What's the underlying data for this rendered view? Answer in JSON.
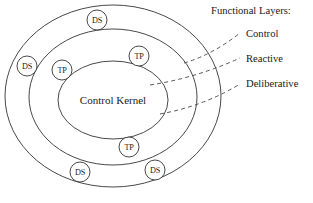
{
  "diagram": {
    "title_text": "Functional Layers:",
    "kernel_label": "Control Kernel",
    "stroke_color": "#333333",
    "text_color": "#1a1a1a",
    "background_color": "#ffffff",
    "ellipses": [
      {
        "name": "outer-ellipse",
        "cx": 113,
        "cy": 96,
        "rx": 108,
        "ry": 91
      },
      {
        "name": "middle-ellipse",
        "cx": 113,
        "cy": 97,
        "rx": 84,
        "ry": 68
      },
      {
        "name": "inner-ellipse",
        "cx": 113,
        "cy": 100,
        "rx": 55,
        "ry": 39
      }
    ],
    "nodes": [
      {
        "id": "ds-top",
        "label": "DS",
        "cx": 97,
        "cy": 20,
        "r": 10
      },
      {
        "id": "ds-left",
        "label": "DS",
        "cx": 27,
        "cy": 66,
        "r": 10
      },
      {
        "id": "ds-bottom-left",
        "label": "DS",
        "cx": 80,
        "cy": 172,
        "r": 10
      },
      {
        "id": "ds-bottom-right",
        "label": "DS",
        "cx": 155,
        "cy": 170,
        "r": 10
      },
      {
        "id": "tp-left",
        "label": "TP",
        "cx": 62,
        "cy": 70,
        "r": 10
      },
      {
        "id": "tp-upper-right",
        "label": "TP",
        "cx": 139,
        "cy": 56,
        "r": 10
      },
      {
        "id": "tp-bottom",
        "label": "TP",
        "cx": 129,
        "cy": 147,
        "r": 10
      }
    ],
    "leaders": [
      {
        "id": "leader-control",
        "x1": 184,
        "y1": 63,
        "x2": 240,
        "y2": 33
      },
      {
        "id": "leader-reactive",
        "x1": 150,
        "y1": 85,
        "x2": 240,
        "y2": 58
      },
      {
        "id": "leader-deliberative",
        "x1": 160,
        "y1": 114,
        "x2": 240,
        "y2": 84
      }
    ],
    "layers": [
      {
        "id": "layer-control",
        "label": "Control",
        "x": 246,
        "y": 33
      },
      {
        "id": "layer-reactive",
        "label": "Reactive",
        "x": 246,
        "y": 58
      },
      {
        "id": "layer-deliberative",
        "label": "Deliberative",
        "x": 246,
        "y": 83
      }
    ],
    "title_position": {
      "x": 211,
      "y": 10
    }
  }
}
